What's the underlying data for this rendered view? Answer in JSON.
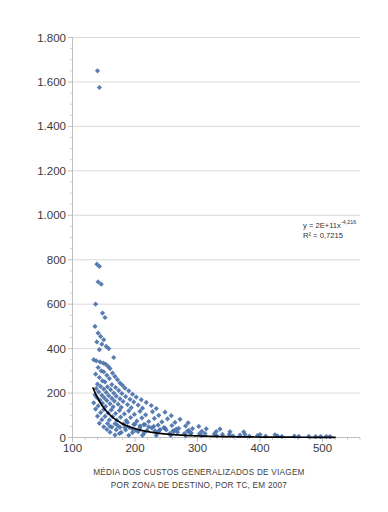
{
  "chart_data": {
    "type": "scatter",
    "title": "",
    "xlabel": "MÉDIA DOS CUSTOS GENERALIZADOS DE VIAGEM POR ZONA DE DESTINO, POR TC, EM 2007",
    "xlabel_line1": "MÉDIA DOS CUSTOS GENERALIZADOS DE VIAGEM",
    "xlabel_line2": "POR ZONA DE DESTINO, POR TC, EM 2007",
    "ylabel": "DENSIDADE DE EMPREGOS EM 2007",
    "xlim": [
      100,
      560
    ],
    "ylim": [
      0,
      1800
    ],
    "xticks": [
      100,
      200,
      300,
      400,
      500
    ],
    "xtick_labels": [
      "100",
      "200",
      "300",
      "400",
      "500"
    ],
    "yticks": [
      0,
      200,
      400,
      600,
      800,
      1000,
      1200,
      1400,
      1600,
      1800
    ],
    "ytick_labels": [
      "0",
      "200",
      "400",
      "600",
      "800",
      "1.000",
      "1.200",
      "1.400",
      "1.600",
      "1.800"
    ],
    "grid": "horizontal-major",
    "legend": "none",
    "marker": "diamond",
    "marker_color": "#4a72ab",
    "trendline_color": "#000000",
    "annotations": [
      {
        "text": "y = 2E+11x",
        "exponent": "-4,216"
      },
      {
        "text": "R² = 0,7215"
      }
    ],
    "equation_label": "y = 2E+11x",
    "equation_exponent": "-4,216",
    "r2_label": "R² = 0,7215",
    "trendline": {
      "form": "power",
      "coefficient": 200000000000.0,
      "exponent": -4.216,
      "r_squared": 0.7215,
      "x_start": 133,
      "x_end": 520
    },
    "points": [
      [
        140,
        1650
      ],
      [
        143,
        1575
      ],
      [
        139,
        780
      ],
      [
        143,
        770
      ],
      [
        141,
        700
      ],
      [
        146,
        690
      ],
      [
        137,
        600
      ],
      [
        148,
        560
      ],
      [
        152,
        540
      ],
      [
        136,
        500
      ],
      [
        141,
        470
      ],
      [
        145,
        455
      ],
      [
        150,
        440
      ],
      [
        139,
        430
      ],
      [
        147,
        420
      ],
      [
        154,
        410
      ],
      [
        158,
        400
      ],
      [
        143,
        395
      ],
      [
        166,
        360
      ],
      [
        134,
        350
      ],
      [
        138,
        345
      ],
      [
        144,
        340
      ],
      [
        149,
        335
      ],
      [
        153,
        330
      ],
      [
        157,
        320
      ],
      [
        141,
        315
      ],
      [
        160,
        310
      ],
      [
        146,
        300
      ],
      [
        150,
        295
      ],
      [
        164,
        290
      ],
      [
        137,
        285
      ],
      [
        155,
        280
      ],
      [
        168,
        275
      ],
      [
        143,
        270
      ],
      [
        159,
        265
      ],
      [
        172,
        260
      ],
      [
        148,
        255
      ],
      [
        152,
        250
      ],
      [
        176,
        245
      ],
      [
        140,
        240
      ],
      [
        163,
        238
      ],
      [
        180,
        235
      ],
      [
        145,
        230
      ],
      [
        156,
        228
      ],
      [
        169,
        225
      ],
      [
        184,
        222
      ],
      [
        138,
        220
      ],
      [
        150,
        218
      ],
      [
        161,
        215
      ],
      [
        174,
        212
      ],
      [
        190,
        210
      ],
      [
        142,
        205
      ],
      [
        154,
        203
      ],
      [
        166,
        200
      ],
      [
        179,
        198
      ],
      [
        196,
        195
      ],
      [
        136,
        192
      ],
      [
        147,
        190
      ],
      [
        158,
        188
      ],
      [
        170,
        186
      ],
      [
        185,
        184
      ],
      [
        202,
        182
      ],
      [
        139,
        180
      ],
      [
        151,
        178
      ],
      [
        163,
        176
      ],
      [
        176,
        174
      ],
      [
        192,
        172
      ],
      [
        210,
        170
      ],
      [
        144,
        168
      ],
      [
        155,
        166
      ],
      [
        167,
        164
      ],
      [
        181,
        162
      ],
      [
        198,
        160
      ],
      [
        218,
        158
      ],
      [
        134,
        156
      ],
      [
        148,
        154
      ],
      [
        160,
        152
      ],
      [
        173,
        150
      ],
      [
        188,
        148
      ],
      [
        205,
        146
      ],
      [
        226,
        144
      ],
      [
        141,
        142
      ],
      [
        153,
        140
      ],
      [
        165,
        138
      ],
      [
        178,
        136
      ],
      [
        194,
        134
      ],
      [
        212,
        132
      ],
      [
        234,
        130
      ],
      [
        137,
        128
      ],
      [
        150,
        126
      ],
      [
        162,
        124
      ],
      [
        175,
        122
      ],
      [
        190,
        120
      ],
      [
        208,
        118
      ],
      [
        228,
        116
      ],
      [
        248,
        114
      ],
      [
        145,
        112
      ],
      [
        157,
        110
      ],
      [
        169,
        108
      ],
      [
        183,
        106
      ],
      [
        199,
        104
      ],
      [
        217,
        102
      ],
      [
        238,
        100
      ],
      [
        258,
        98
      ],
      [
        140,
        96
      ],
      [
        152,
        95
      ],
      [
        164,
        94
      ],
      [
        177,
        92
      ],
      [
        193,
        90
      ],
      [
        211,
        88
      ],
      [
        231,
        86
      ],
      [
        252,
        84
      ],
      [
        272,
        82
      ],
      [
        147,
        80
      ],
      [
        159,
        79
      ],
      [
        171,
        78
      ],
      [
        186,
        76
      ],
      [
        203,
        74
      ],
      [
        222,
        72
      ],
      [
        243,
        70
      ],
      [
        264,
        68
      ],
      [
        285,
        66
      ],
      [
        143,
        64
      ],
      [
        156,
        63
      ],
      [
        168,
        62
      ],
      [
        182,
        60
      ],
      [
        198,
        59
      ],
      [
        216,
        58
      ],
      [
        237,
        56
      ],
      [
        259,
        54
      ],
      [
        281,
        52
      ],
      [
        302,
        50
      ],
      [
        150,
        48
      ],
      [
        163,
        47
      ],
      [
        176,
        46
      ],
      [
        191,
        45
      ],
      [
        208,
        44
      ],
      [
        227,
        43
      ],
      [
        248,
        42
      ],
      [
        270,
        41
      ],
      [
        292,
        40
      ],
      [
        314,
        39
      ],
      [
        336,
        38
      ],
      [
        155,
        36
      ],
      [
        170,
        35
      ],
      [
        185,
        34
      ],
      [
        201,
        33
      ],
      [
        219,
        32
      ],
      [
        239,
        31
      ],
      [
        261,
        30
      ],
      [
        284,
        29
      ],
      [
        307,
        28
      ],
      [
        330,
        27
      ],
      [
        352,
        26
      ],
      [
        374,
        25
      ],
      [
        160,
        24
      ],
      [
        178,
        23
      ],
      [
        196,
        22
      ],
      [
        215,
        21
      ],
      [
        235,
        20
      ],
      [
        256,
        19
      ],
      [
        279,
        18
      ],
      [
        303,
        17
      ],
      [
        327,
        16
      ],
      [
        351,
        15
      ],
      [
        376,
        14
      ],
      [
        400,
        13
      ],
      [
        424,
        12
      ],
      [
        168,
        11
      ],
      [
        190,
        10
      ],
      [
        212,
        10
      ],
      [
        234,
        9
      ],
      [
        257,
        9
      ],
      [
        281,
        8
      ],
      [
        306,
        8
      ],
      [
        331,
        7
      ],
      [
        357,
        7
      ],
      [
        383,
        6
      ],
      [
        409,
        6
      ],
      [
        435,
        5
      ],
      [
        462,
        5
      ],
      [
        489,
        4
      ],
      [
        506,
        4
      ],
      [
        512,
        4
      ],
      [
        175,
        18
      ],
      [
        205,
        26
      ],
      [
        232,
        30
      ],
      [
        250,
        34
      ],
      [
        268,
        24
      ],
      [
        290,
        20
      ],
      [
        160,
        50
      ],
      [
        172,
        55
      ],
      [
        184,
        45
      ],
      [
        196,
        38
      ],
      [
        208,
        52
      ],
      [
        222,
        48
      ],
      [
        240,
        36
      ],
      [
        262,
        28
      ],
      [
        288,
        22
      ],
      [
        312,
        18
      ],
      [
        340,
        14
      ],
      [
        368,
        11
      ],
      [
        396,
        9
      ],
      [
        428,
        7
      ],
      [
        455,
        6
      ],
      [
        478,
        5
      ],
      [
        497,
        4
      ],
      [
        188,
        68
      ],
      [
        200,
        60
      ],
      [
        214,
        58
      ],
      [
        230,
        50
      ],
      [
        246,
        44
      ],
      [
        266,
        38
      ],
      [
        286,
        32
      ]
    ]
  },
  "axis": {
    "y_title": "DENSIDADE DE EMPREGOS EM 2007",
    "x_title_line1": "MÉDIA DOS CUSTOS GENERALIZADOS DE VIAGEM",
    "x_title_line2": "POR ZONA DE DESTINO, POR TC, EM 2007"
  },
  "colors": {
    "marker": "#4a72ab",
    "gridline": "#d0d0d0",
    "axis": "#b8b8b8",
    "trendline": "#000000",
    "text": "#3a3a3a",
    "background": "#ffffff"
  }
}
